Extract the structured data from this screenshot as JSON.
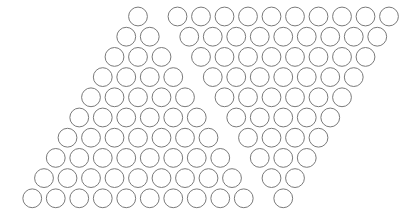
{
  "figure": {
    "background_color": "#ffffff",
    "width": 411,
    "height": 219
  },
  "style": {
    "circle_stroke_color": "#7a7a7a",
    "circle_stroke_width": 1,
    "circle_fill": "none",
    "circle_radius": 9.4,
    "column_pitch": 23.5,
    "row_pitch": 20.2
  },
  "chart_data": {
    "type": "scatter",
    "xlabel": "",
    "ylabel": "",
    "grid": false,
    "legend": "none",
    "marker": "open-circle",
    "groups": [
      {
        "name": "left-triangle",
        "description": "Apex at top, rows widen downward and shift left; 1 to 10 circles per row",
        "row_counts": [
          1,
          2,
          3,
          4,
          5,
          6,
          7,
          8,
          9,
          10
        ],
        "total": 55,
        "apex_center": [
          138,
          16.5
        ],
        "row_shift_x": -11.75,
        "rows": [
          {
            "index": 1,
            "count": 1,
            "y": 16.5,
            "x_start": 138.0
          },
          {
            "index": 2,
            "count": 2,
            "y": 36.7,
            "x_start": 126.25
          },
          {
            "index": 3,
            "count": 3,
            "y": 56.9,
            "x_start": 114.5
          },
          {
            "index": 4,
            "count": 4,
            "y": 77.1,
            "x_start": 102.75
          },
          {
            "index": 5,
            "count": 5,
            "y": 97.3,
            "x_start": 91.0
          },
          {
            "index": 6,
            "count": 6,
            "y": 117.5,
            "x_start": 79.25
          },
          {
            "index": 7,
            "count": 7,
            "y": 137.7,
            "x_start": 67.5
          },
          {
            "index": 8,
            "count": 8,
            "y": 157.9,
            "x_start": 55.75
          },
          {
            "index": 9,
            "count": 9,
            "y": 178.1,
            "x_start": 44.0
          },
          {
            "index": 10,
            "count": 10,
            "y": 198.3,
            "x_start": 32.25
          }
        ]
      },
      {
        "name": "right-triangle",
        "description": "Wide row of 10 at top, narrowing downward and shifting left to a single circle",
        "row_counts": [
          10,
          9,
          8,
          7,
          6,
          5,
          4,
          3,
          2,
          1
        ],
        "total": 55,
        "top_row_first_center": [
          177.5,
          16.5
        ],
        "row_shift_x": -11.75,
        "rows": [
          {
            "index": 1,
            "count": 10,
            "y": 16.5,
            "x_start": 177.5
          },
          {
            "index": 2,
            "count": 9,
            "y": 36.7,
            "x_start": 189.25
          },
          {
            "index": 3,
            "count": 8,
            "y": 56.9,
            "x_start": 201.0
          },
          {
            "index": 4,
            "count": 7,
            "y": 77.1,
            "x_start": 212.75
          },
          {
            "index": 5,
            "count": 6,
            "y": 97.3,
            "x_start": 224.5
          },
          {
            "index": 6,
            "count": 5,
            "y": 117.5,
            "x_start": 236.25
          },
          {
            "index": 7,
            "count": 4,
            "y": 137.7,
            "x_start": 248.0
          },
          {
            "index": 8,
            "count": 3,
            "y": 157.9,
            "x_start": 259.75
          },
          {
            "index": 9,
            "count": 2,
            "y": 178.1,
            "x_start": 271.5
          },
          {
            "index": 10,
            "count": 1,
            "y": 198.3,
            "x_start": 283.25
          }
        ]
      }
    ]
  }
}
